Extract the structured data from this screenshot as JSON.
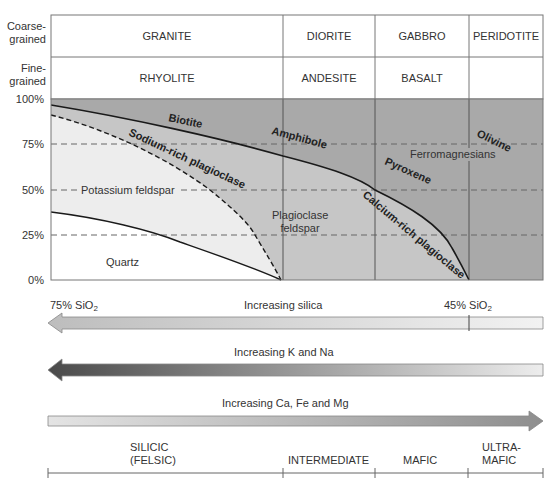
{
  "row_labels": {
    "coarse": "Coarse-\ngrained",
    "fine": "Fine-\ngrained"
  },
  "rock_table": {
    "coarse": [
      "GRANITE",
      "DIORITE",
      "GABBRO",
      "PERIDOTITE"
    ],
    "fine": [
      "RHYOLITE",
      "ANDESITE",
      "BASALT",
      ""
    ]
  },
  "y_axis": {
    "ticks": [
      "100%",
      "75%",
      "50%",
      "25%",
      "0%"
    ]
  },
  "minerals": {
    "biotite": "Biotite",
    "sodium_plagioclase": "Sodium-rich plagioclase",
    "amphibole": "Amphibole",
    "olivine": "Olivine",
    "ferromagnesians": "Ferromagnesians",
    "pyroxene": "Pyroxene",
    "potassium_feldspar": "Potassium feldspar",
    "plagioclase_feldspar_1": "Plagioclase",
    "plagioclase_feldspar_2": "feldspar",
    "calcium_plagioclase": "Calcium-rich plagioclase",
    "quartz": "Quartz"
  },
  "arrows": {
    "silica": {
      "label": "Increasing silica",
      "left": "75% SiO",
      "left_sub": "2",
      "right": "45% SiO",
      "right_sub": "2",
      "direction": "left"
    },
    "k_na": {
      "label": "Increasing K and Na",
      "direction": "left"
    },
    "ca_fe_mg": {
      "label": "Increasing Ca, Fe and Mg",
      "direction": "right"
    }
  },
  "composition_scale": {
    "silicic_1": "SILICIC",
    "silicic_2": "(FELSIC)",
    "intermediate": "INTERMEDIATE",
    "mafic": "MAFIC",
    "ultramafic_1": "ULTRA-",
    "ultramafic_2": "MAFIC"
  },
  "colors": {
    "ferromagnesian_fill": "#a8a8a8",
    "plagioclase_fill": "#c4c4c4",
    "kfeldspar_fill": "#ececec",
    "quartz_fill": "#ffffff",
    "line": "#1a1a1a"
  }
}
